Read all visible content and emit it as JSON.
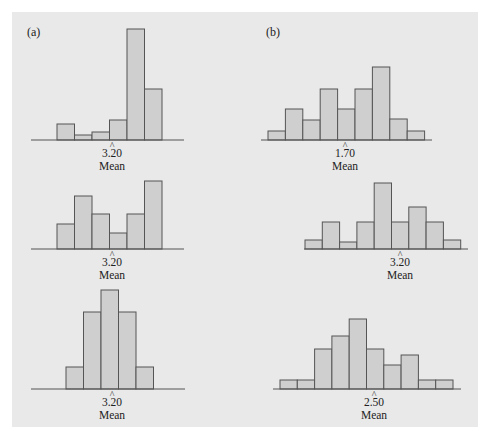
{
  "figure": {
    "panel_labels": [
      "(a)",
      "(b)"
    ],
    "colors": {
      "background": "#e9e9e9",
      "bar_fill": "#cfcfcf",
      "bar_stroke": "#555555"
    }
  },
  "chart_data": [
    {
      "type": "bar",
      "id": "a1",
      "column": "(a)",
      "row": 1,
      "title": "",
      "mean_label": "3.20",
      "mean_word": "Mean",
      "categories": [
        1,
        2,
        3,
        4,
        5,
        6
      ],
      "values": [
        16,
        5,
        8,
        20,
        111,
        51
      ],
      "layout": {
        "baseline_y": 140,
        "axis_x0": 31,
        "axis_x1": 184,
        "bar_x0": 57,
        "bar_width": 17.5,
        "mean_x": 112,
        "scale": 1.0
      }
    },
    {
      "type": "bar",
      "id": "a2",
      "column": "(a)",
      "row": 2,
      "mean_label": "3.20",
      "mean_word": "Mean",
      "categories": [
        1,
        2,
        3,
        4,
        5,
        6
      ],
      "values": [
        25,
        53,
        35,
        16,
        35,
        68
      ],
      "layout": {
        "baseline_y": 249,
        "axis_x0": 31,
        "axis_x1": 184,
        "bar_x0": 57,
        "bar_width": 17.5,
        "mean_x": 112,
        "scale": 1.0
      }
    },
    {
      "type": "bar",
      "id": "a3",
      "column": "(a)",
      "row": 3,
      "mean_label": "3.20",
      "mean_word": "Mean",
      "categories": [
        1,
        2,
        3,
        4,
        5
      ],
      "values": [
        22,
        77,
        99,
        77,
        22
      ],
      "layout": {
        "baseline_y": 389,
        "axis_x0": 31,
        "axis_x1": 185,
        "bar_x0": 66,
        "bar_width": 17.5,
        "mean_x": 112,
        "scale": 1.0
      }
    },
    {
      "type": "bar",
      "id": "b1",
      "column": "(b)",
      "row": 1,
      "mean_label": "1.70",
      "mean_word": "Mean",
      "categories": [
        1,
        2,
        3,
        4,
        5,
        6,
        7,
        8,
        9
      ],
      "values": [
        9,
        31,
        20,
        51,
        31,
        51,
        73,
        21,
        9
      ],
      "layout": {
        "baseline_y": 140,
        "axis_x0": 261,
        "axis_x1": 432,
        "bar_x0": 268,
        "bar_width": 17.4,
        "mean_x": 345,
        "scale": 1.0
      }
    },
    {
      "type": "bar",
      "id": "b2",
      "column": "(b)",
      "row": 2,
      "mean_label": "3.20",
      "mean_word": "Mean",
      "categories": [
        1,
        2,
        3,
        4,
        5,
        6,
        7,
        8,
        9
      ],
      "values": [
        9,
        27,
        7,
        27,
        66,
        27,
        42,
        27,
        9
      ],
      "layout": {
        "baseline_y": 249,
        "axis_x0": 304,
        "axis_x1": 468,
        "bar_x0": 305,
        "bar_width": 17.3,
        "mean_x": 400,
        "scale": 1.0
      }
    },
    {
      "type": "bar",
      "id": "b3",
      "column": "(b)",
      "row": 3,
      "mean_label": "2.50",
      "mean_word": "Mean",
      "categories": [
        1,
        2,
        3,
        4,
        5,
        6,
        7,
        8,
        9,
        10
      ],
      "values": [
        9,
        9,
        40,
        53,
        70,
        40,
        24,
        34,
        9,
        9
      ],
      "layout": {
        "baseline_y": 389,
        "axis_x0": 273,
        "axis_x1": 461,
        "bar_x0": 280,
        "bar_width": 17.3,
        "mean_x": 374,
        "scale": 1.0
      }
    }
  ]
}
